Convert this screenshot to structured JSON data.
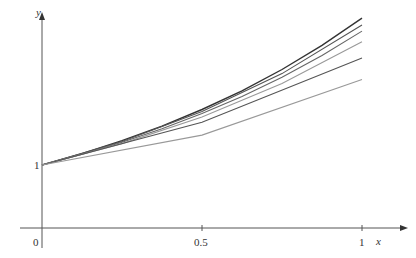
{
  "chart_data": {
    "type": "line",
    "title": "",
    "xlabel": "x",
    "ylabel": "y",
    "x_ticks": [
      "0",
      "0.5",
      "1"
    ],
    "y_ticks": [
      "1"
    ],
    "xlim": [
      0,
      1
    ],
    "grid": false,
    "legend": null,
    "series": [
      {
        "name": "exact y = e^x",
        "color": "#333333",
        "x": [
          0,
          0.125,
          0.25,
          0.375,
          0.5,
          0.625,
          0.75,
          0.875,
          1
        ],
        "values": [
          1,
          1.133,
          1.284,
          1.455,
          1.649,
          1.868,
          2.117,
          2.399,
          2.718
        ]
      },
      {
        "name": "Euler h=1/16",
        "color": "#555555",
        "x": [
          0,
          0.25,
          0.5,
          0.75,
          1
        ],
        "values": [
          1,
          1.274,
          1.624,
          2.069,
          2.637
        ]
      },
      {
        "name": "Euler h=1/8",
        "color": "#666666",
        "x": [
          0,
          0.125,
          0.25,
          0.375,
          0.5,
          0.625,
          0.75,
          0.875,
          1
        ],
        "values": [
          1,
          1.125,
          1.266,
          1.424,
          1.602,
          1.802,
          2.027,
          2.281,
          2.566
        ]
      },
      {
        "name": "Euler h=1/4",
        "color": "#999999",
        "x": [
          0,
          0.25,
          0.5,
          0.75,
          1
        ],
        "values": [
          1,
          1.25,
          1.5625,
          1.953,
          2.441
        ]
      },
      {
        "name": "Euler h=1/2",
        "color": "#555555",
        "x": [
          0,
          0.5,
          1
        ],
        "values": [
          1,
          1.5,
          2.25
        ]
      },
      {
        "name": "Euler h=1",
        "color": "#999999",
        "x": [
          0,
          0.5,
          1
        ],
        "values": [
          1,
          1.35,
          2.0
        ]
      }
    ]
  },
  "labels": {
    "x_axis": "x",
    "y_axis": "y",
    "origin": "0",
    "x_half": "0.5",
    "x_one": "1",
    "y_one": "1"
  }
}
